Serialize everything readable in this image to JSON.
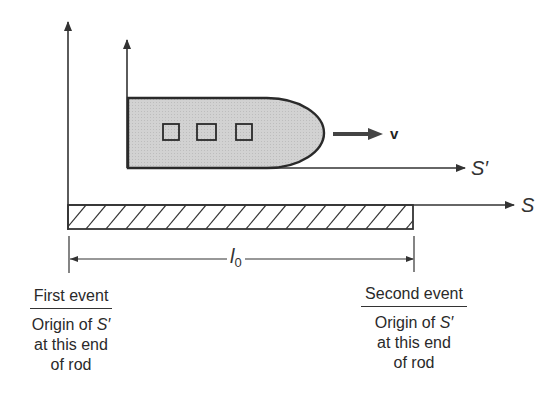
{
  "diagram": {
    "type": "physics-diagram",
    "topic": "proper length of rod measured in frame S with moving frame S'",
    "colors": {
      "line": "#333333",
      "rocket_fill": "#cfcfcf",
      "background": "#ffffff"
    },
    "axes": {
      "stationary_frame_label": "S",
      "moving_frame_label": "S′"
    },
    "velocity_label": "v",
    "length_label": {
      "symbol": "l",
      "subscript": "0"
    },
    "rocket": {
      "window_count": 3
    },
    "events": [
      {
        "title": "First event",
        "line1_prefix": "Origin of ",
        "line1_symbol": "S′",
        "line2": "at this end",
        "line3": "of rod"
      },
      {
        "title": "Second event",
        "line1_prefix": "Origin of ",
        "line1_symbol": "S′",
        "line2": "at this end",
        "line3": "of rod"
      }
    ]
  }
}
